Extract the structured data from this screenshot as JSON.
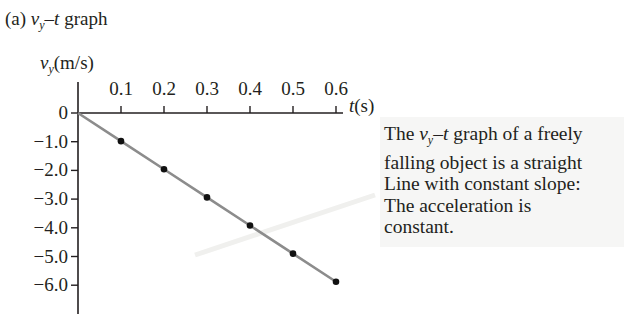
{
  "title": {
    "prefix": "(a) ",
    "var": "v",
    "sub": "y",
    "suffix_italic": "–t",
    "suffix": " graph"
  },
  "annotation": {
    "lines": [
      {
        "prefix": "The ",
        "var": "v",
        "sub": "y",
        "italic": "–t",
        "rest": " graph of a freely"
      },
      {
        "text": "falling object is a straight"
      },
      {
        "text": "Line with constant slope:"
      },
      {
        "text": "The acceleration is"
      },
      {
        "text": "constant."
      }
    ],
    "background": "#f6f6f5"
  },
  "chart_data": {
    "type": "line",
    "xlabel": "t(s)",
    "ylabel": "v_y(m/s)",
    "x": [
      0,
      0.1,
      0.2,
      0.3,
      0.4,
      0.5,
      0.6
    ],
    "series": [
      {
        "name": "v_y",
        "values": [
          0,
          -0.98,
          -1.96,
          -2.94,
          -3.92,
          -4.9,
          -5.88
        ],
        "color": "#8c8c8c",
        "marker_color": "#111111"
      }
    ],
    "xticks": [
      "0.1",
      "0.2",
      "0.3",
      "0.4",
      "0.5",
      "0.6"
    ],
    "yticks": [
      "0",
      "-1.0",
      "-2.0",
      "-3.0",
      "-4.0",
      "-5.0",
      "-6.0"
    ],
    "xlim": [
      0,
      0.6
    ],
    "ylim": [
      -6.5,
      0
    ],
    "grid": false,
    "legend": "none",
    "annotation": "The v_y–t graph of a freely falling object is a straight Line with constant slope: The acceleration is constant."
  }
}
